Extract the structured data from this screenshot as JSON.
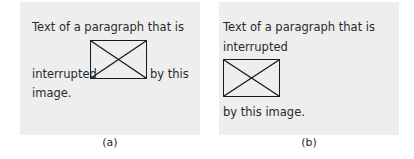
{
  "panel_a": {
    "line1": "Text of a paragraph that is",
    "before_image": "interrupted",
    "after_image": "by this",
    "line3": "image.",
    "caption": "(a)"
  },
  "panel_b": {
    "line1": "Text of a paragraph that is",
    "line2": "interrupted",
    "line3": "by this image.",
    "caption": "(b)"
  },
  "colors": {
    "panel_background": "#eeeeee",
    "text": "#2a2a2a",
    "image_border": "#1a1a1a"
  }
}
